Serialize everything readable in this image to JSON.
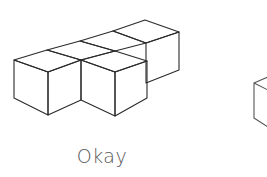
{
  "figure": {
    "caption": "Okay",
    "line_color": "#2a2a2a",
    "caption_color": "#555555"
  }
}
